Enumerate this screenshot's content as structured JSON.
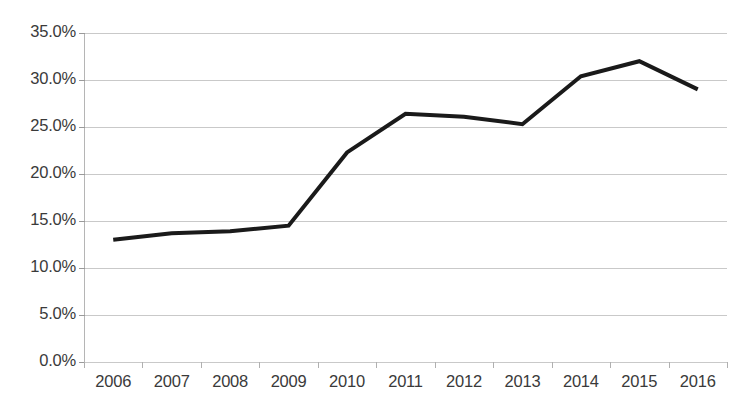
{
  "chart_data": {
    "type": "line",
    "title": "",
    "subtitle": "",
    "xlabel": "",
    "ylabel": "",
    "categories": [
      "2006",
      "2007",
      "2008",
      "2009",
      "2010",
      "2011",
      "2012",
      "2013",
      "2014",
      "2015",
      "2016"
    ],
    "series": [
      {
        "name": "Series 1",
        "values": [
          13.0,
          13.7,
          13.9,
          14.5,
          22.3,
          26.4,
          26.1,
          25.3,
          30.4,
          32.0,
          29.0
        ],
        "color": "#1a1a1a",
        "line_width": 4,
        "markers": false
      }
    ],
    "ylim": [
      0,
      35
    ],
    "ytick_values": [
      0,
      5,
      10,
      15,
      20,
      25,
      30,
      35
    ],
    "ytick_labels": [
      "0.0%",
      "5.0%",
      "10.0%",
      "15.0%",
      "20.0%",
      "25.0%",
      "30.0%",
      "35.0%"
    ],
    "grid": {
      "horizontal": true,
      "vertical": false,
      "color": "#c9c9c9"
    },
    "legend": {
      "visible": false,
      "position": "none"
    },
    "axis": {
      "y_axis_line": true,
      "x_axis_line": false,
      "y_tick_marks": true,
      "x_tick_marks": true
    },
    "background_color": "#ffffff",
    "value_labels": false
  }
}
